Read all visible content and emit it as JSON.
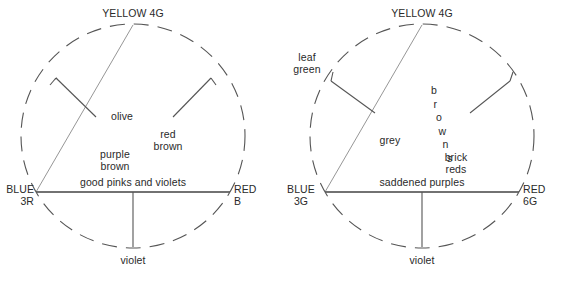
{
  "figure": {
    "line_color": "#4a4a4a",
    "thin_line_color": "#8a8a8a",
    "text_color": "#2a2a2a",
    "background": "#ffffff"
  },
  "diagrams": [
    {
      "id": "left",
      "name": "left-colour-triangle",
      "vertices": {
        "top": {
          "line1": "YELLOW 4G",
          "line2": ""
        },
        "left": {
          "line1": "BLUE",
          "line2": "3R"
        },
        "right": {
          "line1": "RED",
          "line2": "B"
        }
      },
      "interior_labels": [
        {
          "name": "olive",
          "text": "olive"
        },
        {
          "name": "red-brown",
          "text": "red\nbrown"
        },
        {
          "name": "purple-brown",
          "text": "purple\nbrown"
        },
        {
          "name": "good-pinks-and-violets",
          "text": "good pinks and violets"
        }
      ],
      "exterior_labels": [
        {
          "name": "violet",
          "text": "violet"
        }
      ]
    },
    {
      "id": "right",
      "name": "right-colour-triangle",
      "vertices": {
        "top": {
          "line1": "YELLOW 4G",
          "line2": ""
        },
        "left": {
          "line1": "BLUE",
          "line2": "3G"
        },
        "right": {
          "line1": "RED",
          "line2": "6G"
        }
      },
      "interior_labels": [
        {
          "name": "grey",
          "text": "grey"
        },
        {
          "name": "browns",
          "text": "browns"
        },
        {
          "name": "brick-reds",
          "text": "brick\nreds"
        },
        {
          "name": "saddened-purples",
          "text": "saddened purples"
        }
      ],
      "exterior_labels": [
        {
          "name": "leaf-green",
          "text": "leaf\ngreen"
        },
        {
          "name": "violet",
          "text": "violet"
        }
      ]
    }
  ],
  "chart_data": {
    "type": "diagram",
    "panels": [
      {
        "name": "left",
        "vertex_labels": [
          "YELLOW 4G",
          "BLUE 3R",
          "RED B"
        ],
        "region_labels": [
          "olive",
          "red brown",
          "purple brown",
          "good pinks and violets",
          "violet"
        ]
      },
      {
        "name": "right",
        "vertex_labels": [
          "YELLOW 4G",
          "BLUE 3G",
          "RED 6G"
        ],
        "region_labels": [
          "leaf green",
          "grey",
          "browns",
          "brick reds",
          "saddened purples",
          "violet"
        ]
      }
    ]
  }
}
